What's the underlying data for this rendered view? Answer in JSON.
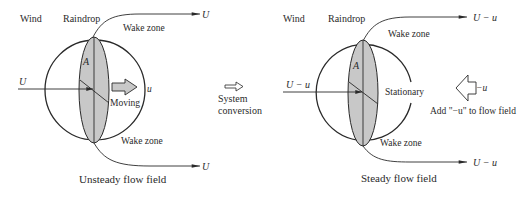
{
  "left_panel": {
    "wind_label": "Wind",
    "raindrop_label": "Raindrop",
    "wake_top_label": "Wake zone",
    "wake_bottom_label": "Wake zone",
    "area_label": "A",
    "inflow_label": "U",
    "outflow_top_label": "U",
    "outflow_bottom_label": "U",
    "motion_label": "Moving",
    "velocity_label": "u",
    "caption": "Unsteady flow field"
  },
  "middle": {
    "conversion_line1": "System",
    "conversion_line2": "conversion",
    "arrow_icon": "hollow-right-arrow"
  },
  "right_panel": {
    "wind_label": "Wind",
    "raindrop_label": "Raindrop",
    "wake_top_label": "Wake zone",
    "wake_bottom_label": "Wake zone",
    "area_label": "A",
    "inflow_label": "U − u",
    "outflow_top_label": "U − u",
    "outflow_bottom_label": "U − u",
    "state_label": "Stationary",
    "added_velocity_label": "−u",
    "add_note": "Add \"−u\" to flow field",
    "caption": "Steady flow field"
  },
  "colors": {
    "line": "#2a2a2a",
    "drop_fill": "#c8c8c8",
    "arrow_fill": "#c8c8c8",
    "background": "#ffffff"
  }
}
